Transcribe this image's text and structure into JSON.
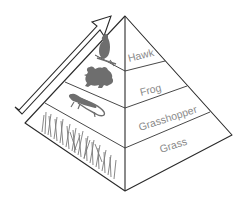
{
  "diagram": {
    "type": "food-pyramid",
    "arrow_direction": "up-the-pyramid",
    "levels": [
      {
        "label": "Hawk",
        "organism_icon": "hawk-icon",
        "trophic_rank": 4
      },
      {
        "label": "Frog",
        "organism_icon": "frog-icon",
        "trophic_rank": 3
      },
      {
        "label": "Grasshopper",
        "organism_icon": "grasshopper-icon",
        "trophic_rank": 2
      },
      {
        "label": "Grass",
        "organism_icon": "grass-icon",
        "trophic_rank": 1
      }
    ],
    "colors": {
      "outline": "#2a2a2a",
      "silhouette": "#6e6e6e",
      "label_text": "#8a8a8a",
      "background": "#ffffff"
    }
  }
}
